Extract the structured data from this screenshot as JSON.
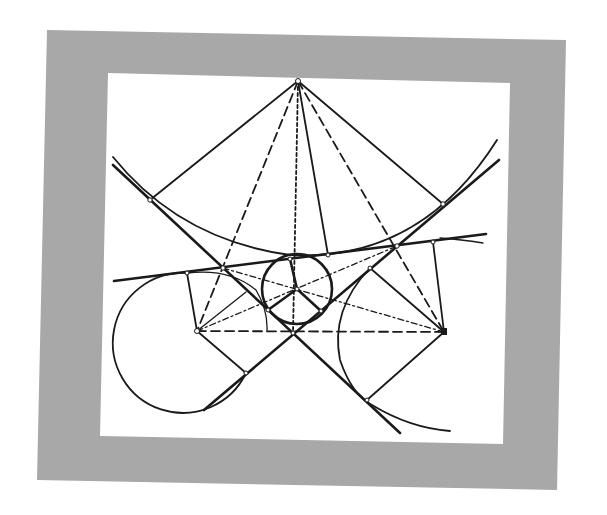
{
  "figure": {
    "frame_color": "#a6a6a6",
    "canvas_color": "#ffffff",
    "line_color": "#1a1a1a"
  },
  "points": {
    "apex": [
      298,
      81
    ],
    "upper_left_tangency": [
      150,
      200
    ],
    "upper_right_tangency": [
      443,
      204
    ],
    "left_cross": [
      223,
      268
    ],
    "right_cross": [
      397,
      246
    ],
    "left_tangent_top": [
      187,
      273
    ],
    "right_tangent_top": [
      433,
      242
    ],
    "small_circle_top": [
      290,
      259
    ],
    "curve_point": [
      328,
      255
    ],
    "small_center": [
      297,
      289
    ],
    "small_left": [
      268,
      310
    ],
    "small_right": [
      321,
      311
    ],
    "lower_cross": [
      293,
      333
    ],
    "left_center": [
      197,
      331
    ],
    "right_center": [
      444,
      332
    ],
    "left_side_tangent": [
      246,
      292
    ],
    "right_side_tangent": [
      370,
      268
    ],
    "left_bottom_tangent": [
      246,
      373
    ],
    "right_bottom_tangent": [
      367,
      400
    ]
  },
  "circles": {
    "small": {
      "cx": 297,
      "cy": 289,
      "r": 35
    },
    "left": {
      "cx": 197,
      "cy": 331,
      "r": 70
    }
  }
}
